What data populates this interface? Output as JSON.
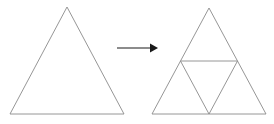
{
  "figure": {
    "background_color": "#ffffff",
    "line_color": "#8a8a8a",
    "arrow_color": "#1a1a1a",
    "width": 274,
    "height": 124
  },
  "left_shape": {
    "name": "equilateral-triangle",
    "label": "",
    "vertices": [
      {
        "name": "apex",
        "x": 67,
        "y": 7
      },
      {
        "name": "bottom-left",
        "x": 10,
        "y": 114
      },
      {
        "name": "bottom-right",
        "x": 124,
        "y": 114
      }
    ],
    "points_attr": "67,7 10,114 124,114"
  },
  "arrow": {
    "name": "transformation-arrow",
    "direction": "right",
    "label": "",
    "shaft": {
      "x1": 117,
      "y1": 48,
      "x2": 150,
      "y2": 48
    },
    "head_points": "150,43.5 158,48 150,52.5"
  },
  "right_shape": {
    "name": "subdivided-triangle",
    "label": "",
    "outer_vertices": [
      {
        "name": "apex",
        "x": 209,
        "y": 8
      },
      {
        "name": "bottom-left",
        "x": 152,
        "y": 114
      },
      {
        "name": "bottom-right",
        "x": 266,
        "y": 114
      }
    ],
    "outer_points_attr": "209,8 152,114 266,114",
    "midpoints": [
      {
        "name": "left-midpoint",
        "x": 180.5,
        "y": 61
      },
      {
        "name": "right-midpoint",
        "x": 237.5,
        "y": 61
      },
      {
        "name": "bottom-midpoint",
        "x": 209,
        "y": 114
      }
    ],
    "inner_triangle_points_attr": "180.5,61 237.5,61 209,114",
    "midsegments": [
      {
        "name": "horizontal-midsegment",
        "x1": 180.5,
        "y1": 61,
        "x2": 237.5,
        "y2": 61
      },
      {
        "name": "left-midsegment",
        "x1": 180.5,
        "y1": 61,
        "x2": 209,
        "y2": 114
      },
      {
        "name": "right-midsegment",
        "x1": 237.5,
        "y1": 61,
        "x2": 209,
        "y2": 114
      }
    ],
    "sub_triangle_count": 4
  }
}
